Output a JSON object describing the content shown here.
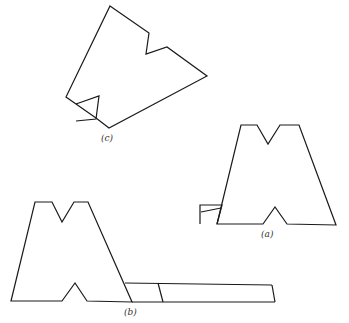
{
  "figure": {
    "labels": {
      "a": "(a)",
      "b": "(b)",
      "c": "(c)"
    },
    "colors": {
      "stroke": "#1a1a1a",
      "background": "#ffffff"
    },
    "shapes": {
      "c": {
        "outline": "110,6 149,33 146,54 167,47 207,76 109,128 96,118 76,104 66,97",
        "tab": "76,104 99,96 96,119 76,121"
      },
      "a": {
        "outline": "217,224 241,125 257,125 268,144 280,125 299,125 336,225 287,224 275,207 263,224",
        "tab": "200,224 200,205 222,205 217,224",
        "tab_crease": "201,212 221,208"
      },
      "b": {
        "outline": "11,301 35,202 52,202 62,222 74,202 88,202 132,302 87,301 75,283 62,301",
        "strip_top": "125,283 272,285",
        "strip_bottom": "132,302 275,302",
        "strip_end": "272,285 275,302",
        "strip_divider": "158,283 163,302"
      }
    }
  }
}
